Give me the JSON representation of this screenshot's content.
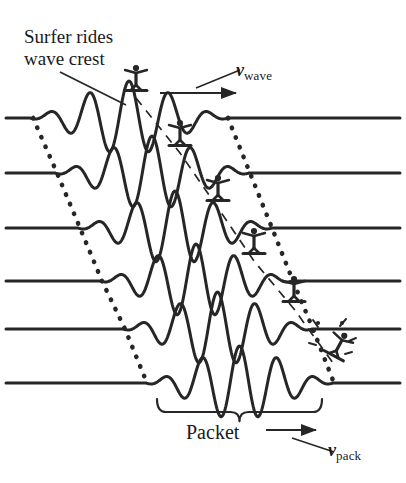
{
  "figure": {
    "width": 406,
    "height": 483,
    "background": "#ffffff",
    "ink_color": "#262626"
  },
  "annotations": {
    "caption_line1": "Surfer rides",
    "caption_line2": "wave crest",
    "packet_label": "Packet",
    "v_wave_symbol": "v",
    "v_wave_subscript": "wave",
    "v_pack_symbol": "v",
    "v_pack_subscript": "pack"
  },
  "chart_data": {
    "type": "line",
    "title": "Surfer rides wave crest",
    "xlabel": "",
    "ylabel": "",
    "grid": false,
    "legend_position": "none",
    "xlim": [
      0,
      406
    ],
    "rows": [
      {
        "index": 1,
        "baseline_y": 118,
        "packet_start": 30,
        "packet_end": 228,
        "surfer_x": 136,
        "surfer_state": "riding"
      },
      {
        "index": 2,
        "baseline_y": 173,
        "packet_start": 55,
        "packet_end": 249,
        "surfer_x": 180,
        "surfer_state": "riding"
      },
      {
        "index": 3,
        "baseline_y": 228,
        "packet_start": 78,
        "packet_end": 272,
        "surfer_x": 218,
        "surfer_state": "riding"
      },
      {
        "index": 4,
        "baseline_y": 281,
        "packet_start": 100,
        "packet_end": 292,
        "surfer_x": 254,
        "surfer_state": "riding"
      },
      {
        "index": 5,
        "baseline_y": 329,
        "packet_start": 123,
        "packet_end": 312,
        "surfer_x": 294,
        "surfer_state": "riding"
      },
      {
        "index": 6,
        "baseline_y": 383,
        "packet_start": 146,
        "packet_end": 333,
        "surfer_x": 333,
        "surfer_state": "wipeout"
      }
    ],
    "envelope_left": [
      [
        33,
        118
      ],
      [
        57,
        173
      ],
      [
        80,
        228
      ],
      [
        102,
        281
      ],
      [
        125,
        329
      ],
      [
        147,
        383
      ]
    ],
    "envelope_right": [
      [
        228,
        118
      ],
      [
        250,
        173
      ],
      [
        272,
        228
      ],
      [
        293,
        281
      ],
      [
        313,
        329
      ],
      [
        334,
        383
      ]
    ],
    "surfer_track": [
      [
        136,
        118
      ],
      [
        180,
        173
      ],
      [
        218,
        228
      ],
      [
        254,
        281
      ],
      [
        294,
        329
      ],
      [
        333,
        383
      ]
    ],
    "arrows": [
      {
        "name": "v_wave_arrow",
        "x1": 160,
        "y1": 93,
        "x2": 236,
        "y2": 93,
        "label": "v_wave"
      },
      {
        "name": "v_pack_arrow",
        "x1": 266,
        "y1": 430,
        "x2": 316,
        "y2": 430,
        "label": "v_pack"
      }
    ],
    "brace": {
      "x_start": 157,
      "x_end": 322,
      "y": 399,
      "label": "Packet"
    },
    "wave_cycles": 5,
    "amplitude_peak": 26
  }
}
